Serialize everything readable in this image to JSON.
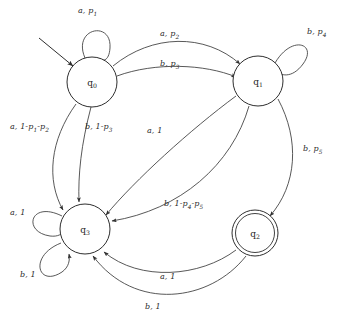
{
  "diagram": {
    "type": "finite-state-machine",
    "title": "",
    "states": [
      {
        "id": "q0",
        "label": "q",
        "subscript": "0",
        "cx": 92,
        "cy": 82,
        "r": 25,
        "accepting": false,
        "start": true
      },
      {
        "id": "q1",
        "label": "q",
        "subscript": "1",
        "cx": 258,
        "cy": 81,
        "r": 25,
        "accepting": false,
        "start": false
      },
      {
        "id": "q2",
        "label": "q",
        "subscript": "2",
        "cx": 255,
        "cy": 233,
        "r": 23,
        "accepting": true,
        "start": false
      },
      {
        "id": "q3",
        "label": "q",
        "subscript": "3",
        "cx": 85,
        "cy": 229,
        "r": 25,
        "accepting": false,
        "start": false
      }
    ],
    "transitions": [
      {
        "id": "t-q0-q0",
        "from": "q0",
        "to": "q0",
        "symbol": "a",
        "weight": "p1",
        "label_text": "a, p",
        "label_sub": "1",
        "label_tail": "",
        "x": 78,
        "y": 6
      },
      {
        "id": "t-q0-q1-a",
        "from": "q0",
        "to": "q1",
        "symbol": "a",
        "weight": "p2",
        "label_text": "a, p",
        "label_sub": "2",
        "label_tail": "",
        "x": 160,
        "y": 29
      },
      {
        "id": "t-q0-q1-b",
        "from": "q0",
        "to": "q1",
        "symbol": "b",
        "weight": "p3",
        "label_text": "b, p",
        "label_sub": "3",
        "label_tail": "",
        "x": 160,
        "y": 59
      },
      {
        "id": "t-q1-q1",
        "from": "q1",
        "to": "q1",
        "symbol": "b",
        "weight": "p4",
        "label_text": "b, p",
        "label_sub": "4",
        "label_tail": "",
        "x": 307,
        "y": 27
      },
      {
        "id": "t-q0-q3-a",
        "from": "q0",
        "to": "q3",
        "symbol": "a",
        "weight": "1-p1-p2",
        "label_text": "a, 1-p",
        "label_sub": "1",
        "label_tail": "-p2",
        "x": 10,
        "y": 122
      },
      {
        "id": "t-q0-q3-b",
        "from": "q0",
        "to": "q3",
        "symbol": "b",
        "weight": "1-p3",
        "label_text": "b, 1-p",
        "label_sub": "3",
        "label_tail": "",
        "x": 85,
        "y": 122
      },
      {
        "id": "t-q1-q3-a",
        "from": "q1",
        "to": "q3",
        "symbol": "a",
        "weight": "1",
        "label_text": "a, 1",
        "label_sub": "",
        "label_tail": "",
        "x": 147,
        "y": 126
      },
      {
        "id": "t-q1-q3-b",
        "from": "q1",
        "to": "q3",
        "symbol": "b",
        "weight": "1-p4-p5",
        "label_text": "b, 1-p",
        "label_sub": "4",
        "label_tail": "-p5",
        "x": 164,
        "y": 199
      },
      {
        "id": "t-q1-q2",
        "from": "q1",
        "to": "q2",
        "symbol": "b",
        "weight": "p5",
        "label_text": "b, p",
        "label_sub": "5",
        "label_tail": "",
        "x": 303,
        "y": 144
      },
      {
        "id": "t-q3-q3-a",
        "from": "q3",
        "to": "q3",
        "symbol": "a",
        "weight": "1",
        "label_text": "a, 1",
        "label_sub": "",
        "label_tail": "",
        "x": 10,
        "y": 208
      },
      {
        "id": "t-q3-q3-b",
        "from": "q3",
        "to": "q3",
        "symbol": "b",
        "weight": "1",
        "label_text": "b, 1",
        "label_sub": "",
        "label_tail": "",
        "x": 20,
        "y": 270
      },
      {
        "id": "t-q2-q3-a",
        "from": "q2",
        "to": "q3",
        "symbol": "a",
        "weight": "1",
        "label_text": "a, 1",
        "label_sub": "",
        "label_tail": "",
        "x": 160,
        "y": 272
      },
      {
        "id": "t-q2-q3-b",
        "from": "q2",
        "to": "q3",
        "symbol": "b",
        "weight": "1",
        "label_text": "b, 1",
        "label_sub": "",
        "label_tail": "",
        "x": 145,
        "y": 302
      }
    ],
    "colors": {
      "stroke": "#3a3a3a",
      "node_stroke": "#2e2e2e",
      "text": "#2b2b2b",
      "background": "#ffffff"
    }
  }
}
